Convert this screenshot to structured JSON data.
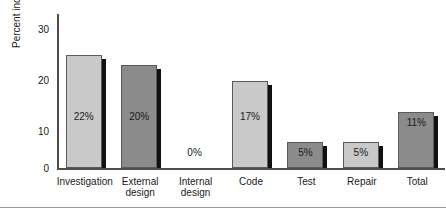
{
  "chart_data": {
    "type": "bar",
    "title": "",
    "xlabel": "",
    "ylabel": "Percent increase",
    "ylim": [
      0,
      30
    ],
    "yticks": [
      "30",
      "20",
      "10",
      "0"
    ],
    "grid": false,
    "legend": false,
    "categories": [
      "Investigation",
      "External design",
      "Internal design",
      "Code",
      "Test",
      "Repair",
      "Total"
    ],
    "category_lines": [
      [
        "Investigation"
      ],
      [
        "External",
        "design"
      ],
      [
        "Internal",
        "design"
      ],
      [
        "Code"
      ],
      [
        "Test"
      ],
      [
        "Repair"
      ],
      [
        "Total"
      ]
    ],
    "values": [
      22,
      20,
      0,
      17,
      5,
      5,
      11
    ],
    "value_labels": [
      "22%",
      "20%",
      "0%",
      "17%",
      "5%",
      "5%",
      "11%"
    ],
    "bar_shades": [
      "light",
      "dark",
      "none",
      "light",
      "dark",
      "light",
      "dark"
    ],
    "colors": {
      "light_bar": "#c9c9c9",
      "dark_bar": "#8b8b8b",
      "bar_outline": "#5a5a5a",
      "bar_shadow": "#111111",
      "axis": "#4d4d4d",
      "text": "#1a1a1a",
      "background": "#ffffff",
      "rule": "#9a9a9a"
    }
  }
}
